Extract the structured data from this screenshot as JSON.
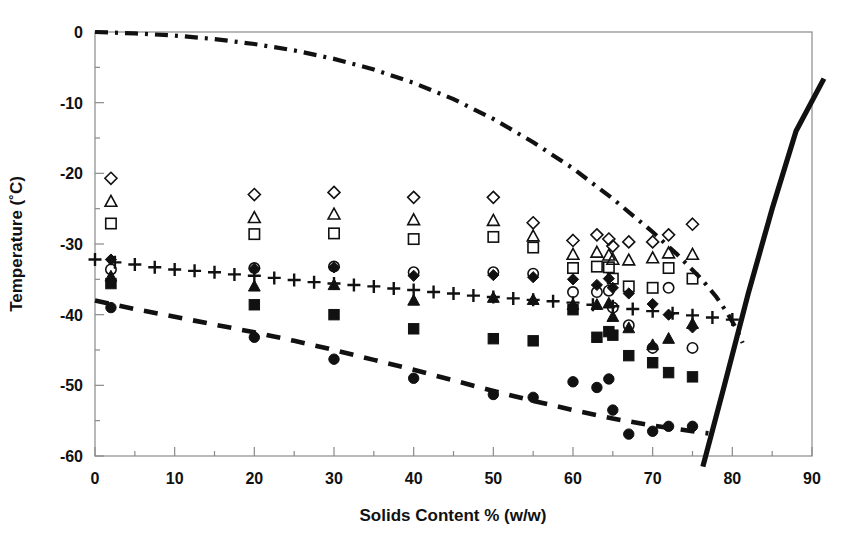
{
  "chart_data": {
    "type": "scatter",
    "title": "",
    "xlabel": "Solids Content % (w/w)",
    "ylabel": "Temperature (˚C)",
    "xlim": [
      0,
      90
    ],
    "ylim": [
      -60,
      0
    ],
    "xticks": [
      0,
      10,
      20,
      30,
      40,
      50,
      60,
      70,
      80,
      90
    ],
    "yticks": [
      0,
      -10,
      -20,
      -30,
      -40,
      -50,
      -60
    ],
    "xtick_labels": [
      "0",
      "10",
      "20",
      "30",
      "40",
      "50",
      "60",
      "70",
      "80",
      "90"
    ],
    "ytick_labels": [
      "0",
      "-10",
      "-20",
      "-30",
      "-40",
      "-50",
      "-60"
    ],
    "xminor_step": 5,
    "yminor_step": 5,
    "grid": false,
    "legend": "none",
    "legend_position": "none",
    "series": [
      {
        "name": "open-diamond",
        "marker": "diamond-open",
        "points": [
          [
            2,
            -20.7
          ],
          [
            20,
            -23.0
          ],
          [
            30,
            -22.7
          ],
          [
            40,
            -23.4
          ],
          [
            50,
            -23.4
          ],
          [
            55,
            -27.0
          ],
          [
            60,
            -29.5
          ],
          [
            63,
            -28.7
          ],
          [
            64.5,
            -29.3
          ],
          [
            65,
            -30.3
          ],
          [
            67,
            -29.7
          ],
          [
            70,
            -29.7
          ],
          [
            72,
            -28.7
          ],
          [
            75,
            -27.2
          ]
        ]
      },
      {
        "name": "open-triangle",
        "marker": "triangle-open",
        "points": [
          [
            2,
            -24.0
          ],
          [
            20,
            -26.3
          ],
          [
            30,
            -25.8
          ],
          [
            40,
            -26.6
          ],
          [
            50,
            -26.7
          ],
          [
            55,
            -28.9
          ],
          [
            60,
            -31.5
          ],
          [
            63,
            -31.2
          ],
          [
            64.5,
            -31.6
          ],
          [
            65,
            -32.2
          ],
          [
            67,
            -32.3
          ],
          [
            70,
            -32.0
          ],
          [
            72,
            -31.3
          ],
          [
            75,
            -31.5
          ]
        ]
      },
      {
        "name": "open-square",
        "marker": "square-open",
        "points": [
          [
            2,
            -27.1
          ],
          [
            20,
            -28.6
          ],
          [
            30,
            -28.5
          ],
          [
            40,
            -29.3
          ],
          [
            50,
            -29.0
          ],
          [
            55,
            -30.5
          ],
          [
            60,
            -33.4
          ],
          [
            63,
            -33.2
          ],
          [
            64.5,
            -33.3
          ],
          [
            65,
            -34.9
          ],
          [
            67,
            -36.0
          ],
          [
            70,
            -36.2
          ],
          [
            72,
            -33.4
          ],
          [
            75,
            -34.9
          ]
        ]
      },
      {
        "name": "open-circle",
        "marker": "circle-open",
        "points": [
          [
            2,
            -33.6
          ],
          [
            20,
            -33.4
          ],
          [
            30,
            -33.2
          ],
          [
            40,
            -34.0
          ],
          [
            50,
            -34.0
          ],
          [
            55,
            -34.2
          ],
          [
            60,
            -36.8
          ],
          [
            63,
            -36.8
          ],
          [
            64.5,
            -36.6
          ],
          [
            65,
            -39.0
          ],
          [
            67,
            -41.5
          ],
          [
            70,
            -44.7
          ],
          [
            72,
            -36.2
          ],
          [
            75,
            -44.7
          ]
        ]
      },
      {
        "name": "filled-diamond",
        "marker": "diamond-filled",
        "points": [
          [
            2,
            -32.2
          ],
          [
            20,
            -33.5
          ],
          [
            30,
            -33.3
          ],
          [
            40,
            -34.5
          ],
          [
            50,
            -34.4
          ],
          [
            55,
            -34.7
          ],
          [
            60,
            -35.0
          ],
          [
            63,
            -35.8
          ],
          [
            64.5,
            -34.9
          ],
          [
            65,
            -36.2
          ],
          [
            67,
            -37.0
          ],
          [
            70,
            -38.5
          ],
          [
            72,
            -40.0
          ],
          [
            75,
            -41.8
          ]
        ]
      },
      {
        "name": "filled-triangle",
        "marker": "triangle-filled",
        "points": [
          [
            2,
            -34.6
          ],
          [
            20,
            -36.0
          ],
          [
            30,
            -35.8
          ],
          [
            40,
            -38.0
          ],
          [
            50,
            -37.6
          ],
          [
            55,
            -37.9
          ],
          [
            60,
            -38.6
          ],
          [
            63,
            -38.6
          ],
          [
            64.5,
            -38.4
          ],
          [
            65,
            -40.3
          ],
          [
            67,
            -41.9
          ],
          [
            70,
            -44.3
          ],
          [
            72,
            -43.4
          ],
          [
            75,
            -41.3
          ]
        ]
      },
      {
        "name": "filled-square",
        "marker": "square-filled",
        "points": [
          [
            2,
            -35.6
          ],
          [
            20,
            -38.6
          ],
          [
            30,
            -40.0
          ],
          [
            40,
            -42.0
          ],
          [
            50,
            -43.4
          ],
          [
            55,
            -43.7
          ],
          [
            60,
            -39.3
          ],
          [
            63,
            -43.2
          ],
          [
            64.5,
            -42.4
          ],
          [
            65,
            -42.9
          ],
          [
            67,
            -45.8
          ],
          [
            70,
            -46.8
          ],
          [
            72,
            -48.2
          ],
          [
            75,
            -48.8
          ]
        ]
      },
      {
        "name": "filled-circle",
        "marker": "circle-filled",
        "points": [
          [
            2,
            -39.0
          ],
          [
            20,
            -43.2
          ],
          [
            30,
            -46.3
          ],
          [
            40,
            -49.0
          ],
          [
            50,
            -51.3
          ],
          [
            55,
            -51.7
          ],
          [
            60,
            -49.5
          ],
          [
            63,
            -50.3
          ],
          [
            64.5,
            -49.1
          ],
          [
            65,
            -53.5
          ],
          [
            67,
            -56.9
          ],
          [
            70,
            -56.5
          ],
          [
            72,
            -55.8
          ],
          [
            75,
            -55.8
          ]
        ]
      },
      {
        "name": "plus-series",
        "marker": "plus",
        "points": [
          [
            0,
            -32.2
          ],
          [
            2.5,
            -32.6
          ],
          [
            5,
            -32.9
          ],
          [
            7.5,
            -33.3
          ],
          [
            10,
            -33.6
          ],
          [
            12.5,
            -33.8
          ],
          [
            15,
            -34.0
          ],
          [
            17.5,
            -34.3
          ],
          [
            20,
            -34.5
          ],
          [
            22.5,
            -34.8
          ],
          [
            25,
            -35.1
          ],
          [
            27.5,
            -35.4
          ],
          [
            30,
            -35.6
          ],
          [
            32.5,
            -35.8
          ],
          [
            35,
            -36.0
          ],
          [
            37.5,
            -36.3
          ],
          [
            40,
            -36.5
          ],
          [
            42.5,
            -36.8
          ],
          [
            45,
            -37.0
          ],
          [
            47.5,
            -37.3
          ],
          [
            50,
            -37.5
          ],
          [
            52.5,
            -37.7
          ],
          [
            55,
            -37.9
          ],
          [
            57.5,
            -38.1
          ],
          [
            60,
            -38.3
          ],
          [
            62.5,
            -38.6
          ],
          [
            65,
            -38.8
          ],
          [
            67.5,
            -39.2
          ],
          [
            70,
            -39.5
          ],
          [
            72.5,
            -39.8
          ],
          [
            75,
            -40.1
          ],
          [
            77.5,
            -40.4
          ],
          [
            80,
            -40.7
          ]
        ]
      }
    ],
    "curves": [
      {
        "name": "freezing-curve",
        "style": "dash-dot",
        "points": [
          [
            0,
            0
          ],
          [
            5,
            -0.2
          ],
          [
            10,
            -0.5
          ],
          [
            15,
            -1.0
          ],
          [
            20,
            -1.7
          ],
          [
            25,
            -2.6
          ],
          [
            30,
            -3.8
          ],
          [
            35,
            -5.3
          ],
          [
            40,
            -7.2
          ],
          [
            45,
            -9.5
          ],
          [
            50,
            -12.3
          ],
          [
            55,
            -15.6
          ],
          [
            60,
            -19.3
          ],
          [
            65,
            -23.6
          ],
          [
            70,
            -28.3
          ],
          [
            73,
            -31.4
          ],
          [
            76,
            -34.8
          ],
          [
            78,
            -37.5
          ],
          [
            79.5,
            -40.0
          ],
          [
            80.5,
            -42.0
          ],
          [
            81.3,
            -44.0
          ]
        ]
      },
      {
        "name": "glass-transition-curve",
        "style": "dashed",
        "points": [
          [
            0,
            -38.0
          ],
          [
            5,
            -39.2
          ],
          [
            10,
            -40.3
          ],
          [
            15,
            -41.4
          ],
          [
            20,
            -42.5
          ],
          [
            25,
            -43.7
          ],
          [
            30,
            -45.0
          ],
          [
            35,
            -46.4
          ],
          [
            40,
            -47.8
          ],
          [
            45,
            -49.3
          ],
          [
            50,
            -50.8
          ],
          [
            55,
            -52.2
          ],
          [
            60,
            -53.5
          ],
          [
            65,
            -54.7
          ],
          [
            70,
            -55.7
          ],
          [
            75,
            -56.5
          ],
          [
            77,
            -56.8
          ]
        ]
      },
      {
        "name": "solidus-line",
        "style": "solid-bold",
        "points": [
          [
            76.3,
            -61.5
          ],
          [
            79,
            -50
          ],
          [
            82,
            -37
          ],
          [
            85,
            -25
          ],
          [
            88,
            -14
          ],
          [
            91.5,
            -6.6
          ]
        ]
      }
    ]
  },
  "plot": {
    "left_px": 95,
    "right_px": 812,
    "top_px": 32,
    "bottom_px": 456
  }
}
